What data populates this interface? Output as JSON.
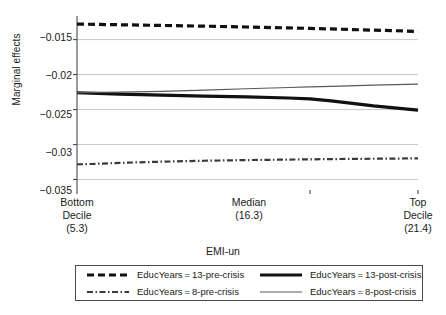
{
  "chart_data": {
    "type": "line",
    "title": "",
    "xlabel": "EMI-un",
    "ylabel": "Marginal effects",
    "ylim": [
      -0.0365,
      -0.0122
    ],
    "yticks": [
      -0.015,
      -0.02,
      -0.025,
      -0.03,
      -0.035
    ],
    "ytick_labels": [
      "−0.015",
      "−0.02",
      "−0.025",
      "−0.03",
      "−0.035"
    ],
    "xlim": [
      5.3,
      21.4
    ],
    "xticks": [
      5.3,
      16.3,
      21.4
    ],
    "xtick_labels": [
      "Bottom\nDecile\n(5.3)",
      "Median\n(16.3)",
      "Top\nDecile\n(21.4)"
    ],
    "xtick_lines": [
      [
        "Bottom",
        "Decile",
        "(5.3)"
      ],
      [
        "Median",
        "(16.3)"
      ],
      [
        "Top",
        "Decile",
        "(21.4)"
      ]
    ],
    "grid": "horizontal",
    "legend_position": "below-axes",
    "x": [
      5.3,
      7.3,
      9.3,
      11.3,
      13.3,
      15.3,
      16.3,
      17.3,
      19.3,
      21.4
    ],
    "series": [
      {
        "name": "EducYears=13-pre-crisis",
        "style": "thick-dashed",
        "color": "#111111",
        "values": [
          -0.01278,
          -0.01288,
          -0.01298,
          -0.01308,
          -0.0132,
          -0.01333,
          -0.0134,
          -0.01348,
          -0.01365,
          -0.01383
        ]
      },
      {
        "name": "EducYears=8-pre-crisis",
        "style": "dash-dot",
        "color": "#3a3a3a",
        "values": [
          -0.03285,
          -0.03263,
          -0.03245,
          -0.03232,
          -0.03222,
          -0.03215,
          -0.03212,
          -0.03208,
          -0.03203,
          -0.03198
        ]
      },
      {
        "name": "EducYears=13-post-crisis",
        "style": "thick-solid",
        "color": "#111111",
        "values": [
          -0.0226,
          -0.0228,
          -0.02295,
          -0.02308,
          -0.0232,
          -0.02335,
          -0.02348,
          -0.02375,
          -0.02448,
          -0.02508
        ]
      },
      {
        "name": "EducYears=8-post-crisis",
        "style": "thin-solid",
        "color": "#5a5a5a",
        "values": [
          -0.02258,
          -0.02252,
          -0.0224,
          -0.02222,
          -0.02203,
          -0.02185,
          -0.02176,
          -0.02168,
          -0.02152,
          -0.02138
        ]
      }
    ]
  },
  "legend": {
    "items": [
      {
        "label": "EducYears = 13-pre-crisis",
        "style": "thick-dashed"
      },
      {
        "label": "EducYears = 13-post-crisis",
        "style": "thick-solid"
      },
      {
        "label": "EducYears = 8-pre-crisis",
        "style": "dash-dot"
      },
      {
        "label": "EducYears = 8-post-crisis",
        "style": "thin-solid"
      }
    ]
  },
  "colors": {
    "axis": "#4a4a4a",
    "grid": "#c9c9c9",
    "text": "#1a1a1a",
    "background": "#ffffff"
  }
}
